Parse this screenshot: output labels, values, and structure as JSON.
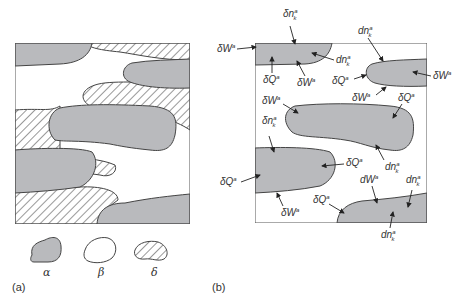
{
  "panels": {
    "a": {
      "label": "(a)"
    },
    "b": {
      "label": "(b)"
    }
  },
  "legend": [
    {
      "phase": "alpha",
      "symbol": "α",
      "fill": "gray"
    },
    {
      "phase": "beta",
      "symbol": "β",
      "fill": "white"
    },
    {
      "phase": "delta",
      "symbol": "δ",
      "fill": "hatched"
    }
  ],
  "annotations": {
    "dW": "δW",
    "dQ": "δQ",
    "dn": "δn",
    "dnk": "dn",
    "dWplain": "dW",
    "sup": "a",
    "sub": "k"
  },
  "colors": {
    "alpha_fill": "#b9babd",
    "outline": "#444444"
  }
}
